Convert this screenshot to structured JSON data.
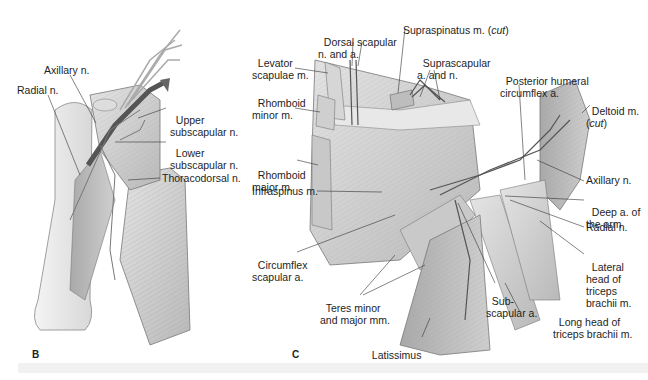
{
  "figure": {
    "panels": [
      {
        "id": "B",
        "letter": "B",
        "labels": {
          "axillary_n": "Axillary n.",
          "radial_n": "Radial n.",
          "upper_subscapular_n_1": "Upper",
          "upper_subscapular_n_2": "subscapular n.",
          "lower_subscapular_n_1": "Lower",
          "lower_subscapular_n_2": "subscapular n.",
          "thoracodorsal_n": "Thoracodorsal n."
        }
      },
      {
        "id": "C",
        "letter": "C",
        "labels": {
          "dorsal_scapular_1": "Dorsal scapular",
          "dorsal_scapular_2": "n. and a.",
          "supraspinatus": "Supraspinatus m. (",
          "supraspinatus_cut": "cut",
          "supraspinatus_close": ")",
          "levator_1": "Levator",
          "levator_2": "scapulae m.",
          "suprascapular_1": "Suprascapular",
          "suprascapular_2": "a. and n.",
          "posterior_humeral_1": "Posterior humeral",
          "posterior_humeral_2": "circumflex a.",
          "rhomboid_minor_1": "Rhomboid",
          "rhomboid_minor_2": "minor m.",
          "deltoid_1": "Deltoid m.",
          "deltoid_cut_open": "(",
          "deltoid_cut": "cut",
          "deltoid_cut_close": ")",
          "rhomboid_major_1": "Rhomboid",
          "rhomboid_major_2": "major m.",
          "infraspinus": "Infraspinus m.",
          "axillary_n": "Axillary n.",
          "deep_a_1": "Deep a. of",
          "deep_a_2": "the arm",
          "radial_n": "Radial n.",
          "circumflex_1": "Circumflex",
          "circumflex_2": "scapular a.",
          "lateral_head_1": "Lateral",
          "lateral_head_2": "head of",
          "lateral_head_3": "triceps",
          "lateral_head_4": "brachii m.",
          "subscapular_1": "Sub-",
          "subscapular_2": "scapular a.",
          "teres_1": "Teres minor",
          "teres_2": "and major mm.",
          "long_head_1": "Long head of",
          "long_head_2": "triceps brachii m.",
          "latissimus_1": "Latissimus",
          "latissimus_2": "dorsi m."
        }
      }
    ]
  }
}
